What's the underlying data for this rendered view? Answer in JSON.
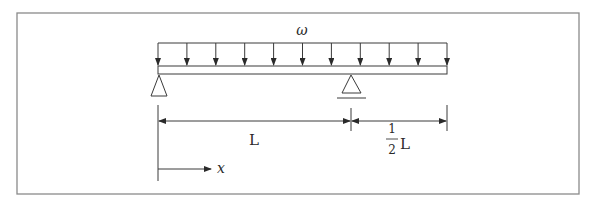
{
  "diagram": {
    "type": "beam-loading",
    "load": {
      "symbol": "ω",
      "kind": "uniformly distributed load",
      "arrow_count": 11
    },
    "supports": [
      {
        "name": "left-pin-support",
        "position": "x=0"
      },
      {
        "name": "right-roller-support",
        "position": "x=L"
      }
    ],
    "dimensions": {
      "span_main": "L",
      "overhang_numerator": "1",
      "overhang_denominator": "2",
      "overhang_unit": "L"
    },
    "axis": {
      "label": "x"
    }
  },
  "colors": {
    "line": "#3a3a3a",
    "frame": "#8a8a8a",
    "background": "#ffffff"
  }
}
